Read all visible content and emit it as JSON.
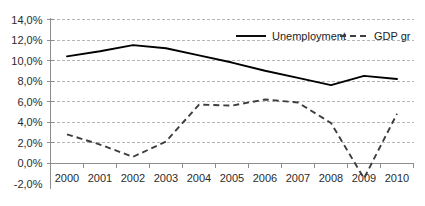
{
  "chart_data": {
    "type": "line",
    "title": "",
    "subtitle": "",
    "xlabel": "",
    "ylabel": "",
    "categories": [
      "2000",
      "2001",
      "2002",
      "2003",
      "2004",
      "2005",
      "2006",
      "2007",
      "2008",
      "2009",
      "2010"
    ],
    "ylim": [
      -2.0,
      14.0
    ],
    "ytick_step": 2.0,
    "ytick_labels": [
      "14,0%",
      "12,0%",
      "10,0%",
      "8,0%",
      "6,0%",
      "4,0%",
      "2,0%",
      "0,0%",
      "-2,0%"
    ],
    "ytick_values": [
      14.0,
      12.0,
      10.0,
      8.0,
      6.0,
      4.0,
      2.0,
      0.0,
      -2.0
    ],
    "grid": true,
    "grid_axis": "y",
    "legend_position": "top-right-inside",
    "series": [
      {
        "name": "Unemployment",
        "style": "solid",
        "color": "#000000",
        "values": [
          10.4,
          10.9,
          11.5,
          11.2,
          10.5,
          9.8,
          9.0,
          8.3,
          7.6,
          8.5,
          8.2
        ]
      },
      {
        "name": "GDP gr",
        "style": "dashed",
        "color": "#3d3d3d",
        "values": [
          2.8,
          1.8,
          0.6,
          2.1,
          5.7,
          5.6,
          6.2,
          5.9,
          3.9,
          -1.5,
          4.8
        ]
      }
    ]
  },
  "legend": {
    "items": [
      {
        "label": "Unemployment"
      },
      {
        "label": "GDP gr"
      }
    ]
  }
}
